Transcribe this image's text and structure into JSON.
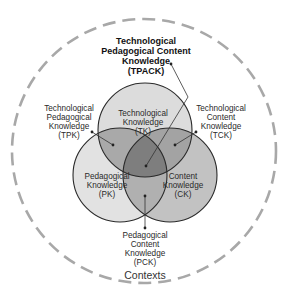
{
  "title": "Technological Pedagogical Content Knowledge (TPACK)",
  "outer": {
    "label": "Contexts",
    "stroke": "#a8a8a8"
  },
  "circles": {
    "tk": {
      "lines": [
        "Technological",
        "Knowledge",
        "(TK)"
      ],
      "fill": "#dcdcdc"
    },
    "pk": {
      "lines": [
        "Pedagogical",
        "Knowledge",
        "(PK)"
      ],
      "fill": "#e2e2e2"
    },
    "ck": {
      "lines": [
        "Content",
        "Knowledge",
        "(CK)"
      ],
      "fill": "#c2c2c2"
    }
  },
  "intersections": {
    "tpk": {
      "lines": [
        "Technological",
        "Pedagogical",
        "Knowledge",
        "(TPK)"
      ],
      "fill": "#a9a9a9"
    },
    "tck": {
      "lines": [
        "Technological",
        "Content",
        "Knowledge",
        "(TCK)"
      ],
      "fill": "#a3a3a3"
    },
    "pck": {
      "lines": [
        "Pedagogical",
        "Content",
        "Knowledge",
        "(PCK)"
      ],
      "fill": "#b0b0b0"
    },
    "tpack": {
      "lines": [
        "Technological",
        "Pedagogical Content",
        "Knowledge",
        "(TPACK)"
      ],
      "fill": "#7e7e7e"
    }
  }
}
